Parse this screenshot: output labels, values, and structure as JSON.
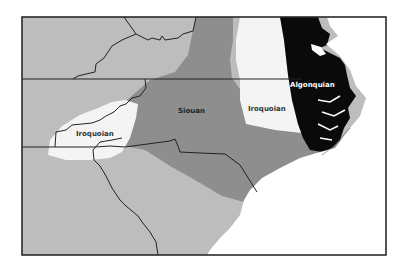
{
  "map": {
    "title": "",
    "regions": [
      {
        "id": "algonquian",
        "label": "Algonquian",
        "fill": "#0a0a0a",
        "label_color": "#ffffff",
        "label_pos": [
          289,
          87
        ]
      },
      {
        "id": "iroquoian-east",
        "label": "Iroquoian",
        "fill": "#f4f4f4",
        "label_color": "#333333",
        "label_pos": [
          262,
          111
        ]
      },
      {
        "id": "siouan",
        "label": "Siouan",
        "fill": "#8e8e8e",
        "label_color": "#222222",
        "label_pos": [
          182,
          113
        ]
      },
      {
        "id": "iroquoian-west",
        "label": "Iroquoian",
        "fill": "#f4f4f4",
        "label_color": "#333333",
        "label_pos": [
          89,
          135
        ]
      },
      {
        "id": "unlabeled-gray",
        "label": "",
        "fill": "#bdbdbd"
      },
      {
        "id": "ocean",
        "label": "",
        "fill": "#ffffff"
      }
    ],
    "colors": {
      "frame": "#2a2a2a",
      "boundary": "#222222",
      "light_region": "#bdbdbd",
      "mid_region": "#8e8e8e",
      "dark_region": "#0a0a0a",
      "pale_region": "#f4f4f4"
    }
  }
}
